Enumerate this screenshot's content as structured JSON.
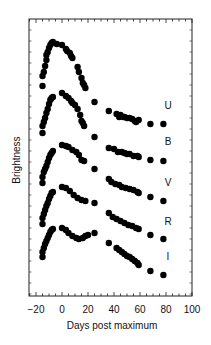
{
  "chart_data": {
    "type": "scatter",
    "title": "",
    "xlabel": "Days post maximum",
    "ylabel": "Brightness",
    "xlim": [
      -25,
      100
    ],
    "x_ticks": [
      -20,
      0,
      20,
      40,
      60,
      80,
      100
    ],
    "y_ticks": [],
    "grid": false,
    "legend": "inline labels at right of each curve",
    "series": [
      {
        "name": "U",
        "points": [
          [
            -15,
            86
          ],
          [
            -15,
            76
          ],
          [
            -14,
            72
          ],
          [
            -13,
            66
          ],
          [
            -12,
            60
          ],
          [
            -12,
            55
          ],
          [
            -11,
            52
          ],
          [
            -10,
            48
          ],
          [
            -9,
            45
          ],
          [
            -8,
            43
          ],
          [
            -7,
            42
          ],
          [
            -4,
            44
          ],
          [
            0,
            45
          ],
          [
            3,
            49
          ],
          [
            4,
            51
          ],
          [
            6,
            53
          ],
          [
            7,
            56
          ],
          [
            8,
            58
          ],
          [
            12,
            67
          ],
          [
            13,
            72
          ],
          [
            15,
            78
          ],
          [
            16,
            83
          ],
          [
            17,
            85
          ],
          [
            18,
            88
          ],
          [
            25,
            102
          ],
          [
            36,
            111
          ],
          [
            42,
            114
          ],
          [
            44,
            117
          ],
          [
            45,
            115
          ],
          [
            47,
            117
          ],
          [
            48,
            117
          ],
          [
            50,
            118
          ],
          [
            52,
            118
          ],
          [
            54,
            119
          ],
          [
            56,
            121
          ],
          [
            57,
            122
          ],
          [
            59,
            120
          ],
          [
            68,
            124
          ],
          [
            78,
            124
          ]
        ],
        "label_pos": [
          148,
          109
        ],
        "offset_px": 0
      },
      {
        "name": "B",
        "points": [
          [
            -15,
            133
          ],
          [
            -15,
            126
          ],
          [
            -14,
            122
          ],
          [
            -13,
            118
          ],
          [
            -12,
            113
          ],
          [
            -11,
            109
          ],
          [
            -10,
            104
          ],
          [
            -9,
            100
          ],
          [
            -8,
            98
          ],
          [
            -7,
            97
          ],
          [
            0,
            93
          ],
          [
            3,
            96
          ],
          [
            5,
            98
          ],
          [
            7,
            101
          ],
          [
            8,
            103
          ],
          [
            10,
            105
          ],
          [
            12,
            109
          ],
          [
            14,
            115
          ],
          [
            15,
            121
          ],
          [
            16,
            123
          ],
          [
            17,
            126
          ],
          [
            25,
            137
          ],
          [
            36,
            148
          ],
          [
            40,
            149
          ],
          [
            43,
            152
          ],
          [
            46,
            152
          ],
          [
            48,
            153
          ],
          [
            50,
            154
          ],
          [
            52,
            154
          ],
          [
            55,
            156
          ],
          [
            58,
            156
          ],
          [
            59,
            157
          ],
          [
            68,
            160
          ],
          [
            78,
            161
          ]
        ],
        "label_pos": [
          148,
          145
        ],
        "offset_px": 0
      },
      {
        "name": "V",
        "points": [
          [
            -15,
            183
          ],
          [
            -15,
            177
          ],
          [
            -14,
            172
          ],
          [
            -13,
            169
          ],
          [
            -12,
            166
          ],
          [
            -11,
            162
          ],
          [
            -10,
            158
          ],
          [
            -9,
            155
          ],
          [
            -8,
            153
          ],
          [
            -7,
            151
          ],
          [
            0,
            145
          ],
          [
            3,
            146
          ],
          [
            5,
            147
          ],
          [
            8,
            150
          ],
          [
            11,
            152
          ],
          [
            13,
            155
          ],
          [
            15,
            160
          ],
          [
            17,
            161
          ],
          [
            25,
            169
          ],
          [
            36,
            179
          ],
          [
            38,
            182
          ],
          [
            41,
            184
          ],
          [
            44,
            185
          ],
          [
            46,
            187
          ],
          [
            49,
            188
          ],
          [
            52,
            189
          ],
          [
            55,
            190
          ],
          [
            58,
            192
          ],
          [
            59,
            193
          ],
          [
            68,
            197
          ],
          [
            78,
            201
          ]
        ],
        "label_pos": [
          148,
          186
        ],
        "offset_px": 0
      },
      {
        "name": "R",
        "points": [
          [
            -15,
            224
          ],
          [
            -15,
            218
          ],
          [
            -14,
            214
          ],
          [
            -13,
            210
          ],
          [
            -12,
            206
          ],
          [
            -11,
            203
          ],
          [
            -10,
            199
          ],
          [
            -9,
            196
          ],
          [
            -8,
            193
          ],
          [
            -7,
            192
          ],
          [
            0,
            187
          ],
          [
            3,
            188
          ],
          [
            6,
            191
          ],
          [
            9,
            195
          ],
          [
            12,
            198
          ],
          [
            15,
            200
          ],
          [
            18,
            201
          ],
          [
            25,
            203
          ],
          [
            36,
            213
          ],
          [
            39,
            217
          ],
          [
            42,
            219
          ],
          [
            45,
            221
          ],
          [
            48,
            223
          ],
          [
            51,
            225
          ],
          [
            54,
            226
          ],
          [
            57,
            228
          ],
          [
            59,
            229
          ],
          [
            68,
            235
          ],
          [
            78,
            239
          ]
        ],
        "label_pos": [
          148,
          225
        ],
        "offset_px": 0
      },
      {
        "name": "I",
        "points": [
          [
            -15,
            257
          ],
          [
            -15,
            252
          ],
          [
            -14,
            248
          ],
          [
            -13,
            244
          ],
          [
            -12,
            241
          ],
          [
            -11,
            238
          ],
          [
            -10,
            235
          ],
          [
            -9,
            232
          ],
          [
            -8,
            230
          ],
          [
            -7,
            229
          ],
          [
            0,
            228
          ],
          [
            3,
            230
          ],
          [
            5,
            233
          ],
          [
            8,
            236
          ],
          [
            11,
            238
          ],
          [
            13,
            239
          ],
          [
            16,
            238
          ],
          [
            18,
            236
          ],
          [
            20,
            235
          ],
          [
            25,
            233
          ],
          [
            36,
            243
          ],
          [
            42,
            248
          ],
          [
            44,
            250
          ],
          [
            46,
            252
          ],
          [
            48,
            254
          ],
          [
            50,
            256
          ],
          [
            52,
            257
          ],
          [
            54,
            259
          ],
          [
            56,
            261
          ],
          [
            58,
            263
          ],
          [
            59,
            265
          ],
          [
            68,
            271
          ],
          [
            78,
            275
          ]
        ],
        "label_pos": [
          148,
          260
        ],
        "offset_px": 0
      }
    ],
    "note": "y values are screen-pixel positions (brightness increases upward); curves are vertically offset for clarity"
  },
  "axes": {
    "x_title": "Days post maximum",
    "y_title": "Brightness",
    "x_tick_labels": [
      "−20",
      "0",
      "20",
      "40",
      "60",
      "80",
      "100"
    ]
  },
  "style": {
    "dot_color": "#000000",
    "axis_color": "#222222"
  }
}
